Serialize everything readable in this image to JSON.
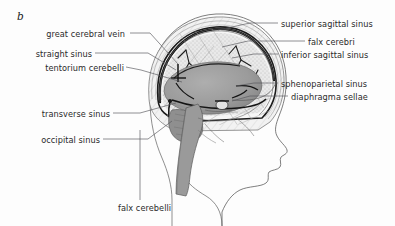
{
  "figure": {
    "panel_letter": "b",
    "type": "anatomical-illustration",
    "view": "left lateral midsagittal",
    "colors": {
      "background": "#fdfdfd",
      "brain_fill": "#9a9a9a",
      "cerebellum_fill": "#8f8f8f",
      "skull_fill": "#efefef",
      "dura_line": "#1c1c1c",
      "outline": "#4a4a4a",
      "label_text": "#2b2b2b",
      "leader_line": "#55555a"
    }
  },
  "labels_left": [
    {
      "id": "great-cerebral-vein",
      "text": "great cerebral vein",
      "text_x": 125,
      "text_y": 36,
      "leader": [
        [
          130,
          33
        ],
        [
          150,
          33
        ],
        [
          178,
          64
        ]
      ]
    },
    {
      "id": "straight-sinus",
      "text": "straight sinus",
      "text_x": 92,
      "text_y": 56,
      "leader": [
        [
          95,
          53
        ],
        [
          148,
          53
        ],
        [
          176,
          70
        ]
      ]
    },
    {
      "id": "tentorium-cerebelli",
      "text": "tentorium cerebelli",
      "text_x": 124,
      "text_y": 70,
      "leader": [
        [
          126,
          67
        ],
        [
          141,
          70
        ],
        [
          182,
          82
        ]
      ]
    },
    {
      "id": "transverse-sinus",
      "text": "transverse sinus",
      "text_x": 110,
      "text_y": 116,
      "leader": [
        [
          113,
          113
        ],
        [
          140,
          113
        ],
        [
          176,
          103
        ]
      ]
    },
    {
      "id": "occipital-sinus",
      "text": "occipital sinus",
      "text_x": 100,
      "text_y": 142,
      "leader": [
        [
          103,
          139
        ],
        [
          148,
          139
        ],
        [
          172,
          121
        ]
      ]
    }
  ],
  "labels_right": [
    {
      "id": "superior-sagittal-sinus",
      "text": "superior sagittal sinus",
      "text_x": 281,
      "text_y": 26,
      "leader": [
        [
          278,
          23
        ],
        [
          250,
          23
        ],
        [
          218,
          30
        ]
      ]
    },
    {
      "id": "falx-cerebri",
      "text": "falx cerebri",
      "text_x": 308,
      "text_y": 44,
      "leader": [
        [
          305,
          41
        ],
        [
          248,
          41
        ],
        [
          222,
          47
        ]
      ]
    },
    {
      "id": "inferior-sagittal-sinus",
      "text": "inferior sagittal sinus",
      "text_x": 281,
      "text_y": 57,
      "leader": [
        [
          278,
          54
        ],
        [
          254,
          54
        ],
        [
          232,
          58
        ]
      ]
    },
    {
      "id": "sphenoparietal-sinus",
      "text": "sphenoparietal sinus",
      "text_x": 281,
      "text_y": 86,
      "leader": [
        [
          278,
          83
        ],
        [
          254,
          83
        ],
        [
          236,
          86
        ]
      ]
    },
    {
      "id": "diaphragma-sellae",
      "text": "diaphragma sellae",
      "text_x": 291,
      "text_y": 99,
      "leader": [
        [
          288,
          96
        ],
        [
          250,
          96
        ],
        [
          232,
          101
        ]
      ]
    }
  ],
  "labels_bottom": [
    {
      "id": "falx-cerebelli",
      "text": "falx cerebelli",
      "text_x": 118,
      "text_y": 210,
      "leader": [
        [
          140,
          200
        ],
        [
          140,
          130
        ]
      ]
    }
  ]
}
